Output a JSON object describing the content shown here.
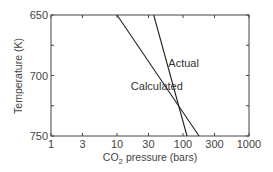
{
  "chart_data": {
    "type": "line",
    "title": "",
    "xlabel": "CO2 pressure (bars)",
    "xlabel_main": "CO",
    "xlabel_sub": "2",
    "xlabel_rest": "pressure (bars)",
    "ylabel": "Temperature (K)",
    "xscale": "log",
    "xlim": [
      1,
      1000
    ],
    "ylim": [
      650,
      750
    ],
    "y_inverted": true,
    "x_ticks": [
      "1",
      "3",
      "10",
      "30",
      "100",
      "300",
      "1000"
    ],
    "x_tick_values": [
      1,
      3,
      10,
      30,
      100,
      300,
      1000
    ],
    "y_ticks": [
      "650",
      "700",
      "750"
    ],
    "y_tick_values": [
      650,
      700,
      750
    ],
    "grid": false,
    "legend": "none (direct labels)",
    "series": [
      {
        "name": "Calculated",
        "x": [
          10,
          175
        ],
        "y": [
          650,
          750
        ]
      },
      {
        "name": "Actual",
        "x": [
          36,
          115
        ],
        "y": [
          650,
          750
        ]
      }
    ],
    "annotations": [
      {
        "text": "Actual",
        "x": 60,
        "y": 690
      },
      {
        "text": "Calculated",
        "x": 20,
        "y": 710
      }
    ]
  }
}
